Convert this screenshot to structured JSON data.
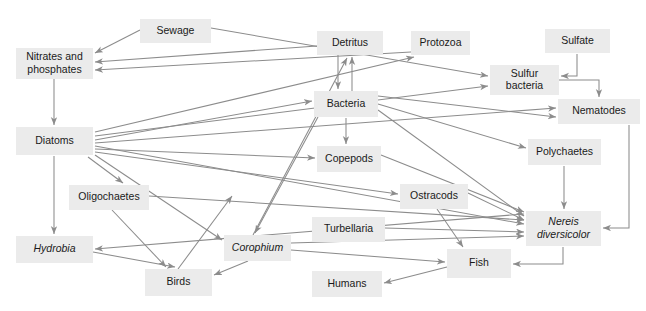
{
  "diagram": {
    "type": "food-web",
    "style": {
      "node_fill": "#ebebeb",
      "node_text": "#1a1a1a",
      "edge_color": "#8c8c8c",
      "background": "#ffffff"
    },
    "nodes": [
      {
        "id": "sewage",
        "label": "Sewage",
        "lines": [
          "Sewage"
        ],
        "italic": false,
        "x": 140,
        "y": 19,
        "w": 71,
        "h": 24
      },
      {
        "id": "nitrates",
        "label": "Nitrates and phosphates",
        "lines": [
          "Nitrates and",
          "phosphates"
        ],
        "italic": false,
        "x": 16,
        "y": 48,
        "w": 77,
        "h": 31
      },
      {
        "id": "detritus",
        "label": "Detritus",
        "lines": [
          "Detritus"
        ],
        "italic": false,
        "x": 317,
        "y": 31,
        "w": 66,
        "h": 24
      },
      {
        "id": "protozoa",
        "label": "Protozoa",
        "lines": [
          "Protozoa"
        ],
        "italic": false,
        "x": 411,
        "y": 31,
        "w": 59,
        "h": 24
      },
      {
        "id": "sulfate",
        "label": "Sulfate",
        "lines": [
          "Sulfate"
        ],
        "italic": false,
        "x": 545,
        "y": 29,
        "w": 65,
        "h": 24
      },
      {
        "id": "sulfur_bacteria",
        "label": "Sulfur bacteria",
        "lines": [
          "Sulfur",
          "bacteria"
        ],
        "italic": false,
        "x": 490,
        "y": 65,
        "w": 69,
        "h": 30
      },
      {
        "id": "nematodes",
        "label": "Nematodes",
        "lines": [
          "Nematodes"
        ],
        "italic": false,
        "x": 558,
        "y": 99,
        "w": 82,
        "h": 25
      },
      {
        "id": "bacteria",
        "label": "Bacteria",
        "lines": [
          "Bacteria"
        ],
        "italic": false,
        "x": 314,
        "y": 91,
        "w": 64,
        "h": 26
      },
      {
        "id": "diatoms",
        "label": "Diatoms",
        "lines": [
          "Diatoms"
        ],
        "italic": false,
        "x": 16,
        "y": 127,
        "w": 77,
        "h": 28
      },
      {
        "id": "copepods",
        "label": "Copepods",
        "lines": [
          "Copepods"
        ],
        "italic": false,
        "x": 317,
        "y": 146,
        "w": 64,
        "h": 26
      },
      {
        "id": "polychaetes",
        "label": "Polychaetes",
        "lines": [
          "Polychaetes"
        ],
        "italic": false,
        "x": 528,
        "y": 139,
        "w": 73,
        "h": 26
      },
      {
        "id": "oligochaetes",
        "label": "Oligochaetes",
        "lines": [
          "Oligochaetes"
        ],
        "italic": false,
        "x": 69,
        "y": 185,
        "w": 80,
        "h": 25
      },
      {
        "id": "ostracods",
        "label": "Ostracods",
        "lines": [
          "Ostracods"
        ],
        "italic": false,
        "x": 400,
        "y": 184,
        "w": 68,
        "h": 25
      },
      {
        "id": "turbellaria",
        "label": "Turbellaria",
        "lines": [
          "Turbellaria"
        ],
        "italic": false,
        "x": 312,
        "y": 217,
        "w": 73,
        "h": 25
      },
      {
        "id": "nereis",
        "label": "Nereis diversicolor",
        "lines": [
          "Nereis",
          "diversicolor"
        ],
        "italic": true,
        "x": 526,
        "y": 211,
        "w": 75,
        "h": 35
      },
      {
        "id": "hydrobia",
        "label": "Hydrobia",
        "lines": [
          "Hydrobia"
        ],
        "italic": true,
        "x": 16,
        "y": 236,
        "w": 77,
        "h": 27
      },
      {
        "id": "corophium",
        "label": "Corophium",
        "lines": [
          "Corophium"
        ],
        "italic": true,
        "x": 224,
        "y": 235,
        "w": 67,
        "h": 26
      },
      {
        "id": "fish",
        "label": "Fish",
        "lines": [
          "Fish"
        ],
        "italic": false,
        "x": 447,
        "y": 249,
        "w": 64,
        "h": 29
      },
      {
        "id": "birds",
        "label": "Birds",
        "lines": [
          "Birds"
        ],
        "italic": false,
        "x": 145,
        "y": 269,
        "w": 67,
        "h": 27
      },
      {
        "id": "humans",
        "label": "Humans",
        "lines": [
          "Humans"
        ],
        "italic": false,
        "x": 312,
        "y": 271,
        "w": 70,
        "h": 26
      }
    ],
    "edges": [
      {
        "from": "sewage",
        "to": "nitrates",
        "label": "sewage to nitrates and phosphates",
        "path": "M 140,30 L 95,53"
      },
      {
        "from": "sewage",
        "to": "sulfur_bacteria",
        "label": "sewage to sulfur bacteria",
        "path": "M 211,28 L 488,76"
      },
      {
        "from": "detritus",
        "to": "nitrates",
        "label": "detritus to nitrates and phosphates",
        "path": "M 317,46 L 95,62"
      },
      {
        "from": "protozoa",
        "to": "nitrates",
        "label": "protozoa to nitrates and phosphates",
        "path": "M 411,52 L 95,70"
      },
      {
        "from": "nitrates",
        "to": "diatoms",
        "label": "nitrates and phosphates to diatoms",
        "path": "M 54,79 L 54,125"
      },
      {
        "from": "bacteria",
        "to": "detritus",
        "label": "bacteria to detritus",
        "path": "M 352,91 L 352,57"
      },
      {
        "from": "detritus",
        "to": "bacteria",
        "label": "detritus to bacteria",
        "path": "M 338,55 L 338,89"
      },
      {
        "from": "corophium",
        "to": "detritus",
        "label": "corophium to detritus",
        "path": "M 253,235 L 347,58"
      },
      {
        "from": "diatoms",
        "to": "protozoa",
        "label": "diatoms to protozoa",
        "path": "M 95,132 L 414,57"
      },
      {
        "from": "diatoms",
        "to": "sulfur_bacteria",
        "label": "diatoms to sulfur bacteria",
        "path": "M 95,136 L 488,86"
      },
      {
        "from": "diatoms",
        "to": "bacteria",
        "label": "diatoms to bacteria",
        "path": "M 95,140 L 312,101"
      },
      {
        "from": "diatoms",
        "to": "nematodes",
        "label": "diatoms to nematodes",
        "path": "M 95,143 L 556,108"
      },
      {
        "from": "diatoms",
        "to": "nereis",
        "label": "diatoms to nereis diversicolor",
        "path": "M 95,146 L 524,224"
      },
      {
        "from": "diatoms",
        "to": "copepods",
        "label": "diatoms to copepods",
        "path": "M 95,149 L 315,158"
      },
      {
        "from": "diatoms",
        "to": "ostracods",
        "label": "diatoms to ostracods",
        "path": "M 95,152 L 398,194"
      },
      {
        "from": "diatoms",
        "to": "corophium",
        "label": "diatoms to corophium",
        "path": "M 95,155 L 222,240"
      },
      {
        "from": "diatoms",
        "to": "oligochaetes",
        "label": "diatoms to oligochaetes",
        "path": "M 88,157 L 123,183"
      },
      {
        "from": "diatoms",
        "to": "hydrobia",
        "label": "diatoms to hydrobia",
        "path": "M 54,156 L 54,234"
      },
      {
        "from": "bacteria",
        "to": "nematodes",
        "label": "bacteria to nematodes",
        "path": "M 378,96 L 556,117"
      },
      {
        "from": "bacteria",
        "to": "polychaetes",
        "label": "bacteria to polychaetes",
        "path": "M 378,104 L 526,148"
      },
      {
        "from": "bacteria",
        "to": "nereis",
        "label": "bacteria to nereis diversicolor",
        "path": "M 378,110 L 524,216"
      },
      {
        "from": "bacteria",
        "to": "copepods",
        "label": "bacteria to copepods",
        "path": "M 346,118 L 346,144"
      },
      {
        "from": "bacteria",
        "to": "corophium",
        "label": "bacteria to corophium",
        "path": "M 318,117 L 255,233"
      },
      {
        "from": "sulfate",
        "to": "sulfur_bacteria",
        "label": "sulfate to sulfur bacteria",
        "path": "M 577,54 L 577,76 L 561,76"
      },
      {
        "from": "sulfur_bacteria",
        "to": "nematodes",
        "label": "sulfur bacteria to nematodes",
        "path": "M 559,80 L 599,80 L 599,97"
      },
      {
        "from": "nematodes",
        "to": "nereis",
        "label": "nematodes to nereis diversicolor",
        "path": "M 629,125 L 629,228 L 603,228"
      },
      {
        "from": "polychaetes",
        "to": "nereis",
        "label": "polychaetes to nereis diversicolor",
        "path": "M 564,166 L 564,209"
      },
      {
        "from": "oligochaetes",
        "to": "nereis",
        "label": "oligochaetes to nereis diversicolor",
        "path": "M 149,196 L 524,220"
      },
      {
        "from": "oligochaetes",
        "to": "birds",
        "label": "oligochaetes to birds",
        "path": "M 112,210 L 166,267"
      },
      {
        "from": "copepods",
        "to": "nereis",
        "label": "copepods to nereis diversicolor",
        "path": "M 381,155 L 524,212"
      },
      {
        "from": "ostracods",
        "to": "nereis",
        "label": "ostracods to nereis diversicolor",
        "path": "M 468,193 L 524,220"
      },
      {
        "from": "ostracods",
        "to": "fish",
        "label": "ostracods to fish",
        "path": "M 437,209 L 463,247"
      },
      {
        "from": "turbellaria",
        "to": "nereis",
        "label": "turbellaria to nereis diversicolor",
        "path": "M 385,228 L 524,232"
      },
      {
        "from": "corophium",
        "to": "nereis",
        "label": "corophium to nereis diversicolor",
        "path": "M 291,243 L 524,236"
      },
      {
        "from": "corophium",
        "to": "birds",
        "label": "corophium to birds",
        "path": "M 248,261 L 214,275"
      },
      {
        "from": "corophium",
        "to": "fish",
        "label": "corophium to fish",
        "path": "M 291,250 L 445,262"
      },
      {
        "from": "hydrobia",
        "to": "birds",
        "label": "hydrobia to birds",
        "path": "M 93,252 L 175,267"
      },
      {
        "from": "nereis",
        "to": "hydrobia",
        "label": "nereis diversicolor to hydrobia",
        "path": "M 524,214 L 95,249"
      },
      {
        "from": "nereis",
        "to": "fish",
        "label": "nereis diversicolor to fish",
        "path": "M 563,247 L 563,264 L 513,264"
      },
      {
        "from": "fish",
        "to": "humans",
        "label": "fish to humans",
        "path": "M 447,267 L 384,283"
      },
      {
        "from": "birds",
        "to": "corophium",
        "label": "birds to corophium",
        "path": "M 178,269 L 232,196"
      }
    ]
  }
}
